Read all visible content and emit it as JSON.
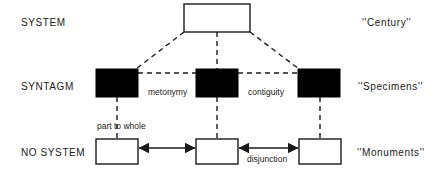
{
  "diagram": {
    "colors": {
      "stroke": "#1a1a1a",
      "fill_open": "#ffffff",
      "fill_solid": "#000000",
      "background": "#ffffff"
    },
    "rows": [
      {
        "id": "system",
        "left_label": "SYSTEM",
        "right_label": "''Century''"
      },
      {
        "id": "syntagm",
        "left_label": "SYNTAGM",
        "right_label": "''Specimens''"
      },
      {
        "id": "no-system",
        "left_label": "NO SYSTEM",
        "right_label": "''Monuments''"
      }
    ],
    "nodes": [
      {
        "id": "system-box",
        "style": "open",
        "x": 184,
        "y": 4,
        "w": 66,
        "h": 28
      },
      {
        "id": "syntagm-box-left",
        "style": "solid",
        "x": 96,
        "y": 69,
        "w": 42,
        "h": 28
      },
      {
        "id": "syntagm-box-mid",
        "style": "solid",
        "x": 196,
        "y": 69,
        "w": 42,
        "h": 28
      },
      {
        "id": "syntagm-box-right",
        "style": "solid",
        "x": 298,
        "y": 69,
        "w": 42,
        "h": 28
      },
      {
        "id": "nosystem-box-left",
        "style": "open",
        "x": 96,
        "y": 139,
        "w": 42,
        "h": 25
      },
      {
        "id": "nosystem-box-mid",
        "style": "open",
        "x": 196,
        "y": 139,
        "w": 42,
        "h": 25
      },
      {
        "id": "nosystem-box-right",
        "style": "open",
        "x": 299,
        "y": 139,
        "w": 42,
        "h": 25
      }
    ],
    "edge_labels": [
      {
        "id": "metonymy",
        "text": "metonymy"
      },
      {
        "id": "contiguity",
        "text": "contiguity"
      },
      {
        "id": "part-to-whole",
        "text": "part to whole"
      },
      {
        "id": "disjunction",
        "text": "disjunction"
      }
    ]
  }
}
